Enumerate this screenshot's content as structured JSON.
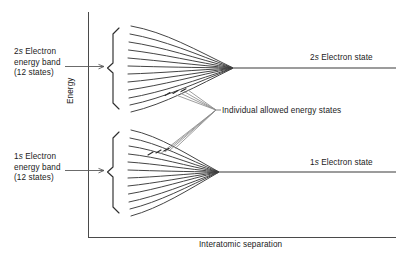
{
  "figure": {
    "type": "energy-band-splitting-diagram",
    "axes": {
      "x_label_prefix": "Interatomic",
      "x_label": "Interatomic separation",
      "y_label": "Energy",
      "x_axis": {
        "x1": 88,
        "y1": 237,
        "x2": 396,
        "y2": 237
      },
      "y_axis": {
        "x1": 88,
        "y1": 12,
        "x2": 88,
        "y2": 237
      }
    },
    "line_color": "#3c3c3c",
    "text_color": "#1a1a1a",
    "labels": {
      "band_2s": {
        "line1_pre": "2",
        "line1_italic": "s",
        "line1_post": " Electron",
        "line2": "energy band",
        "line3": "(12 states)"
      },
      "band_1s": {
        "line1_pre": "1",
        "line1_italic": "s",
        "line1_post": " Electron",
        "line2": "energy band",
        "line3": "(12 states)"
      },
      "state_2s": {
        "pre": "2",
        "italic": "s",
        "post": " Electron state"
      },
      "state_1s": {
        "pre": "1",
        "italic": "s",
        "post": " Electron state"
      },
      "individual_states": "Individual allowed energy states"
    },
    "bands": [
      {
        "name": "2s",
        "states": 12,
        "brace": {
          "x": 112,
          "top": 28,
          "bottom": 109,
          "mid": 68
        },
        "fan": {
          "left_x": 132,
          "converge_x": 232,
          "converge_y": 68,
          "spread_top": 26,
          "spread_bottom": 112
        },
        "state_line": {
          "x1": 232,
          "y": 68,
          "x2": 396
        }
      },
      {
        "name": "1s",
        "states": 12,
        "brace": {
          "x": 112,
          "top": 132,
          "bottom": 213,
          "mid": 172
        },
        "fan": {
          "left_x": 132,
          "converge_x": 218,
          "converge_y": 172,
          "spread_top": 130,
          "spread_bottom": 216
        },
        "state_line": {
          "x1": 218,
          "y": 172,
          "x2": 396
        }
      }
    ],
    "callouts": {
      "individual_states_vertex": {
        "x": 216,
        "y": 110
      },
      "upper_target": {
        "x": 176,
        "y": 96
      },
      "lower_target": {
        "x": 160,
        "y": 153
      }
    }
  }
}
